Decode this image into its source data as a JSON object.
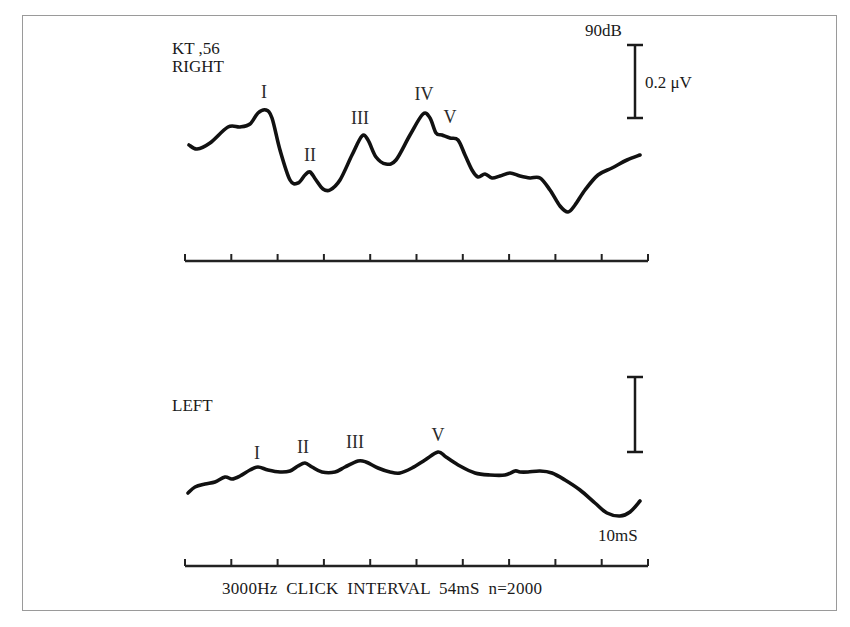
{
  "chart_data": [
    {
      "type": "line",
      "title": "RIGHT",
      "subject": "KT ,56",
      "stimulus_level": "90dB",
      "scale_bar": "0.2 μV",
      "peak_labels": [
        "I",
        "II",
        "III",
        "IV",
        "V"
      ],
      "x_axis": {
        "ticks": 11,
        "range_ms": [
          0,
          10
        ],
        "grid": false
      },
      "series": [
        {
          "name": "RIGHT",
          "points": [
            [
              189,
              145
            ],
            [
              197,
              149
            ],
            [
              210,
              143
            ],
            [
              228,
              127
            ],
            [
              240,
              127
            ],
            [
              250,
              124
            ],
            [
              258,
              113
            ],
            [
              266,
              110
            ],
            [
              272,
              118
            ],
            [
              280,
              150
            ],
            [
              290,
              180
            ],
            [
              298,
              183
            ],
            [
              305,
              175
            ],
            [
              310,
              172
            ],
            [
              316,
              180
            ],
            [
              323,
              189
            ],
            [
              330,
              190
            ],
            [
              340,
              180
            ],
            [
              352,
              155
            ],
            [
              362,
              136
            ],
            [
              368,
              140
            ],
            [
              376,
              157
            ],
            [
              386,
              164
            ],
            [
              396,
              160
            ],
            [
              410,
              135
            ],
            [
              423,
              114
            ],
            [
              430,
              118
            ],
            [
              436,
              133
            ],
            [
              442,
              135
            ],
            [
              450,
              138
            ],
            [
              458,
              140
            ],
            [
              465,
              155
            ],
            [
              472,
              170
            ],
            [
              478,
              177
            ],
            [
              485,
              174
            ],
            [
              492,
              178
            ],
            [
              500,
              176
            ],
            [
              510,
              173
            ],
            [
              520,
              176
            ],
            [
              530,
              178
            ],
            [
              540,
              178
            ],
            [
              550,
              190
            ],
            [
              560,
              206
            ],
            [
              568,
              212
            ],
            [
              575,
              205
            ],
            [
              585,
              190
            ],
            [
              598,
              175
            ],
            [
              612,
              168
            ],
            [
              627,
              160
            ],
            [
              640,
              155
            ]
          ]
        }
      ]
    },
    {
      "type": "line",
      "title": "LEFT",
      "peak_labels": [
        "I",
        "II",
        "III",
        "V"
      ],
      "x_axis": {
        "ticks": 11,
        "range_ms": [
          0,
          10
        ],
        "label": "10mS",
        "grid": false
      },
      "series": [
        {
          "name": "LEFT",
          "points": [
            [
              188,
              493
            ],
            [
              195,
              487
            ],
            [
              205,
              484
            ],
            [
              215,
              482
            ],
            [
              225,
              477
            ],
            [
              232,
              479
            ],
            [
              240,
              476
            ],
            [
              250,
              470
            ],
            [
              258,
              467
            ],
            [
              268,
              470
            ],
            [
              280,
              472
            ],
            [
              290,
              471
            ],
            [
              298,
              466
            ],
            [
              305,
              463
            ],
            [
              312,
              467
            ],
            [
              322,
              472
            ],
            [
              335,
              472
            ],
            [
              345,
              467
            ],
            [
              358,
              461
            ],
            [
              366,
              462
            ],
            [
              378,
              468
            ],
            [
              390,
              472
            ],
            [
              400,
              473
            ],
            [
              412,
              468
            ],
            [
              425,
              460
            ],
            [
              438,
              452
            ],
            [
              446,
              457
            ],
            [
              460,
              466
            ],
            [
              475,
              473
            ],
            [
              490,
              475
            ],
            [
              505,
              475
            ],
            [
              515,
              471
            ],
            [
              520,
              472
            ],
            [
              528,
              472
            ],
            [
              540,
              471
            ],
            [
              552,
              473
            ],
            [
              565,
              480
            ],
            [
              580,
              490
            ],
            [
              595,
              503
            ],
            [
              607,
              513
            ],
            [
              620,
              516
            ],
            [
              630,
              512
            ],
            [
              640,
              501
            ]
          ]
        }
      ]
    }
  ],
  "labels": {
    "subject": "KT ,56",
    "right": "RIGHT",
    "left": "LEFT",
    "level": "90dB",
    "scale": "0.2 μV",
    "time_scale": "10mS",
    "footer": "3000Hz  CLICK  INTERVAL  54mS  n=2000"
  },
  "peaks_right": [
    {
      "label": "I",
      "x": 264,
      "y": 83
    },
    {
      "label": "II",
      "x": 310,
      "y": 146
    },
    {
      "label": "III",
      "x": 360,
      "y": 109
    },
    {
      "label": "IV",
      "x": 424,
      "y": 85
    },
    {
      "label": "V",
      "x": 450,
      "y": 108
    }
  ],
  "peaks_left": [
    {
      "label": "I",
      "x": 257,
      "y": 444
    },
    {
      "label": "II",
      "x": 303,
      "y": 438
    },
    {
      "label": "III",
      "x": 355,
      "y": 433
    },
    {
      "label": "V",
      "x": 438,
      "y": 426
    }
  ]
}
